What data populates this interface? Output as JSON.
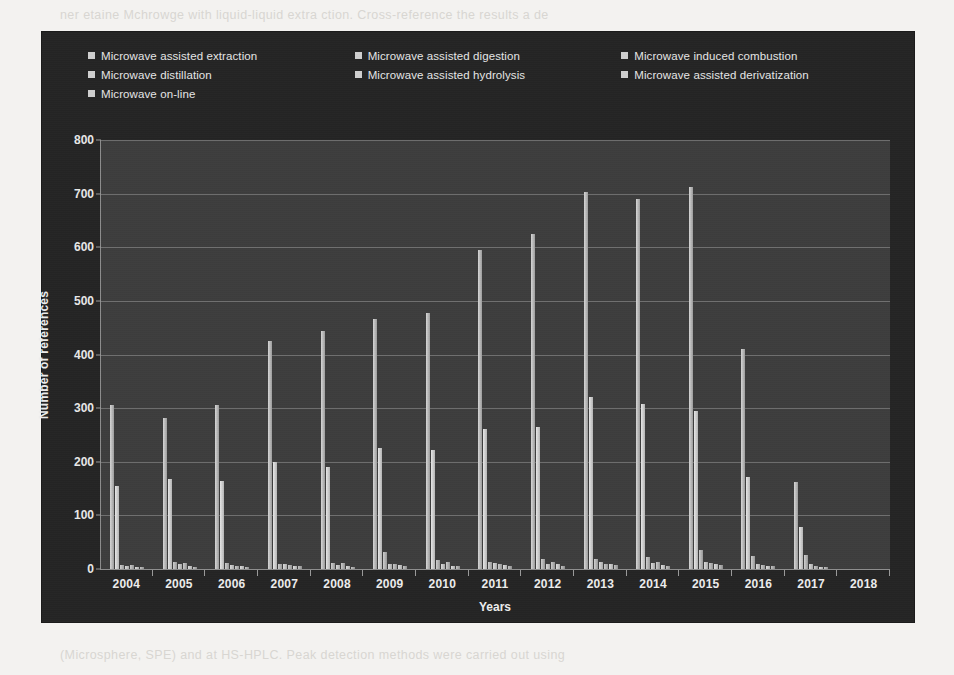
{
  "page": {
    "ghost_top": "ner etaine Mchrowge with liquid-liquid extra ction. Cross-reference the results a de",
    "ghost_bottom": "   (Microsphere, SPE) and at HS-HPLC. Peak detection methods were carried out using"
  },
  "legend": {
    "items": [
      {
        "label": "Microwave assisted extraction",
        "swatch": "#cfcfcf"
      },
      {
        "label": "Microwave assisted digestion",
        "swatch": "#cfcfcf"
      },
      {
        "label": "Microwave induced  combustion",
        "swatch": "#cfcfcf"
      },
      {
        "label": "Microwave  distillation",
        "swatch": "#cfcfcf"
      },
      {
        "label": "Microwave  assisted  hydrolysis",
        "swatch": "#cfcfcf"
      },
      {
        "label": "Microwave  assisted  derivatization",
        "swatch": "#cfcfcf"
      },
      {
        "label": "Microwave  on-line",
        "swatch": "#cfcfcf"
      }
    ]
  },
  "chart_data": {
    "type": "bar",
    "title": "",
    "xlabel": "Years",
    "ylabel": "Number of references",
    "ylim": [
      0,
      800
    ],
    "ytick_step": 100,
    "yticks": [
      0,
      100,
      200,
      300,
      400,
      500,
      600,
      700,
      800
    ],
    "grid": true,
    "legend_position": "top",
    "categories": [
      "2004",
      "2005",
      "2006",
      "2007",
      "2008",
      "2009",
      "2010",
      "2011",
      "2012",
      "2013",
      "2014",
      "2015",
      "2016",
      "2017",
      "2018"
    ],
    "series": [
      {
        "name": "Microwave assisted extraction",
        "values": [
          305,
          282,
          305,
          425,
          443,
          467,
          477,
          595,
          625,
          703,
          690,
          712,
          410,
          163,
          0
        ]
      },
      {
        "name": "Microwave assisted digestion",
        "values": [
          155,
          167,
          165,
          200,
          190,
          225,
          222,
          262,
          265,
          320,
          308,
          295,
          172,
          79,
          0
        ]
      },
      {
        "name": "Microwave induced  combustion",
        "values": [
          8,
          14,
          12,
          10,
          12,
          32,
          16,
          13,
          19,
          19,
          22,
          35,
          25,
          27,
          0
        ]
      },
      {
        "name": "Microwave  distillation",
        "values": [
          6,
          9,
          7,
          9,
          8,
          10,
          9,
          12,
          10,
          14,
          12,
          14,
          10,
          9,
          0
        ]
      },
      {
        "name": "Microwave  assisted  hydrolysis",
        "values": [
          7,
          11,
          6,
          8,
          11,
          9,
          13,
          10,
          14,
          10,
          13,
          12,
          8,
          5,
          0
        ]
      },
      {
        "name": "Microwave  assisted  derivatization",
        "values": [
          4,
          6,
          5,
          6,
          5,
          7,
          6,
          8,
          9,
          9,
          8,
          9,
          6,
          4,
          0
        ]
      },
      {
        "name": "Microwave  on-line",
        "values": [
          3,
          4,
          4,
          5,
          4,
          5,
          5,
          6,
          6,
          7,
          6,
          7,
          5,
          3,
          0
        ]
      }
    ]
  }
}
